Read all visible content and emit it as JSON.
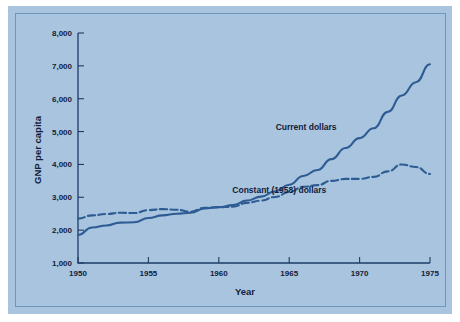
{
  "figure": {
    "background_color": "#a9c4de",
    "border_color": "#6f96bd",
    "line_color": "#2d5c94",
    "text_color": "#11203a"
  },
  "chart_data": {
    "type": "line",
    "title": "",
    "xlabel": "Year",
    "ylabel": "GNP per capita",
    "xlim": [
      1950,
      1975
    ],
    "ylim": [
      1000,
      8000
    ],
    "xticks": [
      1950,
      1955,
      1960,
      1965,
      1970,
      1975
    ],
    "xtick_labels": [
      "1950",
      "1955",
      "1960",
      "1965",
      "1970",
      "1975"
    ],
    "yticks": [
      1000,
      2000,
      3000,
      4000,
      5000,
      6000,
      7000,
      8000
    ],
    "ytick_labels": [
      "1,000",
      "2,000",
      "3,000",
      "4,000",
      "5,000",
      "6,000",
      "7,000",
      "8,000"
    ],
    "grid": false,
    "legend_position": "inline-annotation",
    "x": [
      1950,
      1951,
      1952,
      1953,
      1954,
      1955,
      1956,
      1957,
      1958,
      1959,
      1960,
      1961,
      1962,
      1963,
      1964,
      1965,
      1966,
      1967,
      1968,
      1969,
      1970,
      1971,
      1972,
      1973,
      1974,
      1975
    ],
    "series": [
      {
        "name": "Current dollars",
        "style": "solid",
        "label": "Current dollars",
        "values": [
          1850,
          2080,
          2140,
          2230,
          2240,
          2370,
          2450,
          2500,
          2530,
          2660,
          2700,
          2760,
          2900,
          3020,
          3180,
          3380,
          3650,
          3830,
          4160,
          4500,
          4800,
          5100,
          5600,
          6100,
          6500,
          7050
        ]
      },
      {
        "name": "Constant (1958) dollars",
        "style": "dashed",
        "label": "Constant (1958) dollars",
        "values": [
          2350,
          2450,
          2490,
          2530,
          2520,
          2610,
          2640,
          2620,
          2560,
          2680,
          2700,
          2710,
          2830,
          2900,
          3010,
          3160,
          3320,
          3370,
          3500,
          3560,
          3560,
          3620,
          3790,
          4000,
          3920,
          3710
        ]
      }
    ]
  },
  "annotations": [
    {
      "text": "Current dollars",
      "x": 1966.2,
      "y": 5050
    },
    {
      "text": "Constant (1958) dollars",
      "x": 1964.3,
      "y": 3130
    }
  ]
}
